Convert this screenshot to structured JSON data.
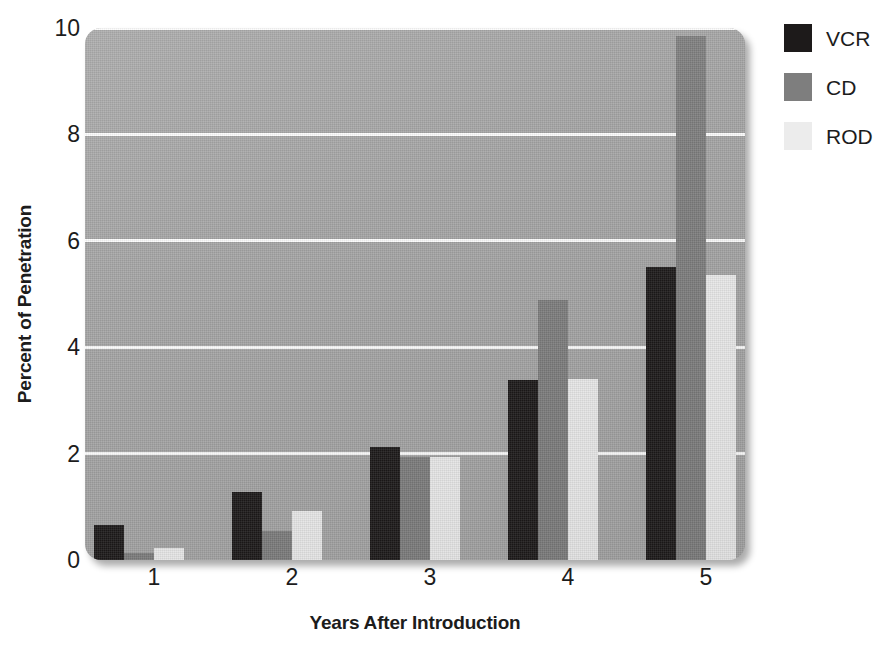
{
  "chart_data": {
    "type": "bar",
    "title": "",
    "xlabel": "Years After Introduction",
    "ylabel": "Percent of Penetration",
    "categories": [
      "1",
      "2",
      "3",
      "4",
      "5"
    ],
    "series": [
      {
        "name": "VCR",
        "color": "#1d1a1a",
        "values": [
          0.65,
          1.28,
          2.12,
          3.38,
          5.5
        ]
      },
      {
        "name": "CD",
        "color": "#7e7e7e",
        "values": [
          0.13,
          0.55,
          1.93,
          4.88,
          9.85
        ]
      },
      {
        "name": "ROD",
        "color": "#ececec",
        "values": [
          0.22,
          0.92,
          1.93,
          3.4,
          5.35
        ]
      }
    ],
    "ylim": [
      0,
      10
    ],
    "yticks": [
      0,
      2,
      4,
      6,
      8,
      10
    ],
    "ytick_labels": [
      "0",
      "2",
      "4",
      "6",
      "8",
      "10"
    ],
    "xtick_labels": [
      "1",
      "2",
      "3",
      "4",
      "5"
    ],
    "grid": "horizontal",
    "gridline_color": "#fdfdfd",
    "plot_background": "#a5a5a5",
    "legend_position": "right-top",
    "legend_entries": [
      "VCR",
      "CD",
      "ROD"
    ]
  }
}
